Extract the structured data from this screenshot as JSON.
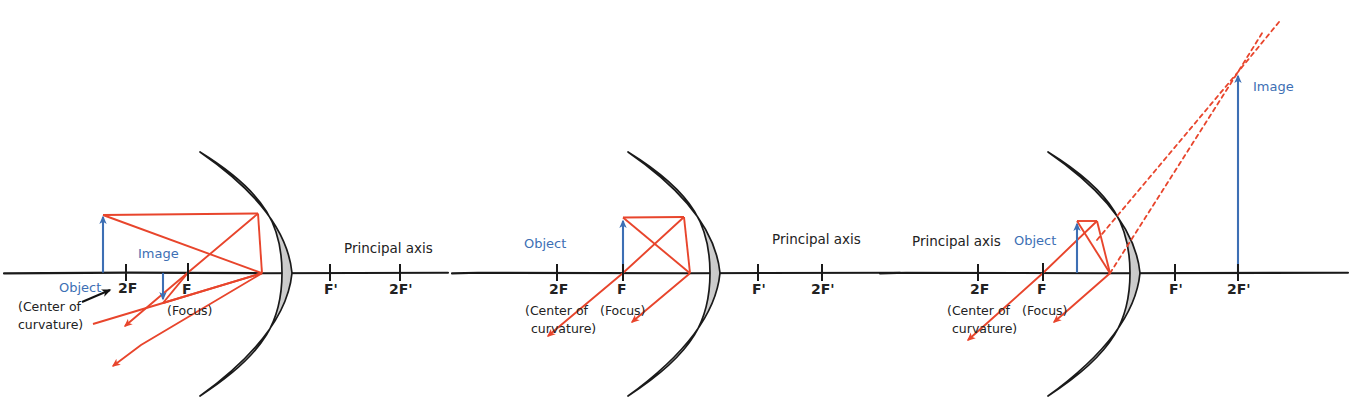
{
  "figure": {
    "colors": {
      "ray": "#e8452c",
      "object_image": "#3d6fb4",
      "axis": "#1a1a1a",
      "mirror_outline": "#1a1a1a",
      "mirror_fill_light": "#ffffff",
      "mirror_fill_shade": "#cfcfcf"
    }
  },
  "diagrams": [
    {
      "id": "object-beyond-2f",
      "axis_y": 273,
      "mirror_x": 262,
      "labels": {
        "object": "Object",
        "image": "Image",
        "two_f": "2F",
        "f": "F",
        "focus": "(Focus)",
        "center_line1": "(Center of",
        "center_line2": "curvature)",
        "f_prime": "F'",
        "two_f_prime": "2F'",
        "principal_axis": "Principal axis"
      },
      "marks": {
        "two_f_x": 126,
        "f_x": 188,
        "f_prime_x": 330,
        "two_f_prime_x": 400
      },
      "object": {
        "x": 103,
        "top_y": 213,
        "direction": "up"
      },
      "image": {
        "x": 163,
        "top_y": 303,
        "direction": "down"
      }
    },
    {
      "id": "object-at-f",
      "axis_y": 273,
      "mirror_x": 690,
      "labels": {
        "object": "Object",
        "two_f": "2F",
        "f": "F",
        "focus": "(Focus)",
        "center_line1": "(Center of",
        "center_line2": "curvature)",
        "f_prime": "F'",
        "two_f_prime": "2F'",
        "principal_axis": "Principal axis"
      },
      "marks": {
        "two_f_x": 557,
        "f_x": 623,
        "f_prime_x": 758,
        "two_f_prime_x": 822
      },
      "object": {
        "x": 623,
        "top_y": 217,
        "direction": "up"
      },
      "image": null
    },
    {
      "id": "object-between-f-and-mirror",
      "axis_y": 273,
      "mirror_x": 1110,
      "labels": {
        "object": "Object",
        "image": "Image",
        "two_f": "2F",
        "f": "F",
        "focus": "(Focus)",
        "center_line1": "(Center of",
        "center_line2": "curvature)",
        "f_prime": "F'",
        "two_f_prime": "2F'",
        "principal_axis": "Principal axis"
      },
      "marks": {
        "two_f_x": 978,
        "f_x": 1043,
        "f_prime_x": 1175,
        "two_f_prime_x": 1238
      },
      "object": {
        "x": 1077,
        "top_y": 218,
        "direction": "up"
      },
      "image": {
        "x": 1238,
        "top_y": 72,
        "direction": "up",
        "virtual": true
      }
    }
  ]
}
